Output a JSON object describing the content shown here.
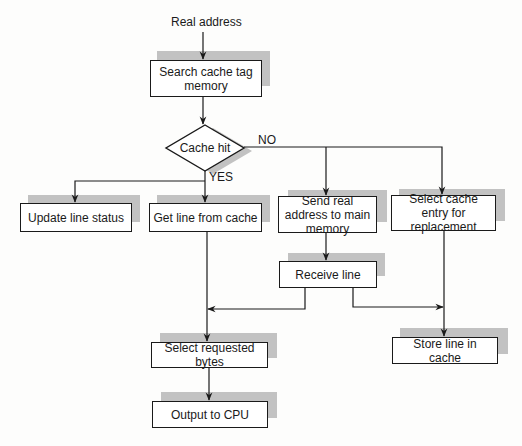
{
  "diagram": {
    "type": "flowchart",
    "input_label": "Real address",
    "nodes": {
      "search": {
        "label": "Search cache tag memory"
      },
      "decision": {
        "label": "Cache hit"
      },
      "update": {
        "label": "Update line status"
      },
      "get_line": {
        "label": "Get line from cache"
      },
      "send": {
        "label": "Send real address to main memory"
      },
      "select_entry": {
        "label": "Select cache entry for replacement"
      },
      "receive": {
        "label": "Receive line"
      },
      "select_bytes": {
        "label": "Select requested bytes"
      },
      "store": {
        "label": "Store line in cache"
      },
      "output": {
        "label": "Output to CPU"
      }
    },
    "branch_labels": {
      "yes": "YES",
      "no": "NO"
    },
    "edges": [
      {
        "from": "Real address",
        "to": "search"
      },
      {
        "from": "search",
        "to": "decision"
      },
      {
        "from": "decision",
        "to": "update",
        "label": "YES"
      },
      {
        "from": "decision",
        "to": "get_line",
        "label": "YES"
      },
      {
        "from": "decision",
        "to": "send",
        "label": "NO"
      },
      {
        "from": "decision",
        "to": "select_entry",
        "label": "NO"
      },
      {
        "from": "send",
        "to": "receive"
      },
      {
        "from": "receive",
        "to": "select_bytes"
      },
      {
        "from": "receive",
        "to": "store"
      },
      {
        "from": "get_line",
        "to": "select_bytes"
      },
      {
        "from": "select_entry",
        "to": "store"
      },
      {
        "from": "select_bytes",
        "to": "output"
      }
    ],
    "colors": {
      "line": "#1a1a1a",
      "shadow": "#c2c2c2",
      "box_fill": "#ffffff"
    }
  }
}
